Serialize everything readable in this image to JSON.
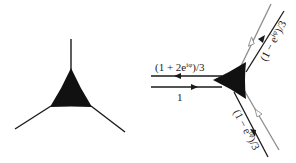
{
  "colors": {
    "background": "#ffffff",
    "ink": "#1a1a1a",
    "gray_line": "#8c8c8c",
    "vertex_fill": "#111111"
  },
  "left_diagram": {
    "description": "Trivalent vertex with three legs",
    "vertex": "filled-triangle"
  },
  "right_diagram": {
    "vertex": "filled-triangle",
    "labels": {
      "top_left_line": "(1 + 2e^{iφ})/3",
      "top_left_line_display": "(1 + 2e",
      "top_left_sup": "iφ",
      "top_left_tail": ")/3",
      "bottom_left_line": "1",
      "upper_right_line": "(1 − e^{iφ})/3",
      "upper_right_display": "(1 − e",
      "upper_right_sup": "iφ",
      "upper_right_tail": ")/3",
      "lower_right_line": "(1 − e^{iφ})/3",
      "lower_right_display": "(1 − e",
      "lower_right_sup": "iφ",
      "lower_right_tail": ")/3"
    },
    "arrows": {
      "top_left": "arrow-left-filled",
      "bottom_left": "arrow-right-filled",
      "upper_right_black": "arrow-up-right-filled",
      "upper_right_gray": "arrow-down-left-hollow",
      "lower_right_black": "arrow-down-right-filled",
      "lower_right_gray": "arrow-up-left-hollow"
    }
  }
}
